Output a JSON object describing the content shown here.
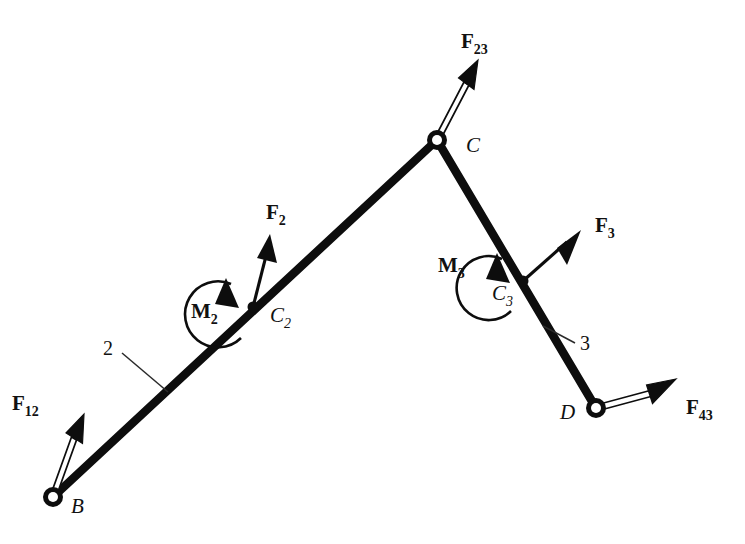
{
  "figure": {
    "background_color": "#ffffff",
    "ink_color": "#0d0d0d",
    "width": 745,
    "height": 544,
    "type": "free-body-diagram"
  },
  "joints": [
    {
      "id": "B",
      "label": "B",
      "x": 53,
      "y": 497,
      "style": "pin-hollow",
      "label_x": 71,
      "label_y": 513
    },
    {
      "id": "C",
      "label": "C",
      "x": 437,
      "y": 140,
      "style": "pin-hollow",
      "label_x": 466,
      "label_y": 152
    },
    {
      "id": "D",
      "label": "D",
      "x": 596,
      "y": 408,
      "style": "pin-hollow",
      "label_x": 560,
      "label_y": 419
    }
  ],
  "mass_centers": [
    {
      "id": "C2",
      "label": "C",
      "sub": "2",
      "x": 253,
      "y": 307,
      "label_x": 270,
      "label_y": 322
    },
    {
      "id": "C3",
      "label": "C",
      "sub": "3",
      "x": 523,
      "y": 281,
      "label_x": 492,
      "label_y": 300
    }
  ],
  "links": [
    {
      "id": "2",
      "label": "2",
      "from": "B",
      "to": "C",
      "label_x": 103,
      "label_y": 355,
      "leader_from_x": 122,
      "leader_from_y": 353,
      "leader_to_x": 168,
      "leader_to_y": 392
    },
    {
      "id": "3",
      "label": "3",
      "from": "C",
      "to": "D",
      "label_x": 580,
      "label_y": 350,
      "leader_from_x": 575,
      "leader_from_y": 343,
      "leader_to_x": 543,
      "leader_to_y": 326
    }
  ],
  "forces": [
    {
      "id": "F12",
      "label": "F",
      "sub": "12",
      "style": "open",
      "tail_x": 53,
      "tail_y": 497,
      "tip_x": 84,
      "tip_y": 414,
      "label_x": 12,
      "label_y": 410
    },
    {
      "id": "F23",
      "label": "F",
      "sub": "23",
      "style": "open",
      "tail_x": 437,
      "tail_y": 140,
      "tip_x": 478,
      "tip_y": 60,
      "label_x": 461,
      "label_y": 48
    },
    {
      "id": "F43",
      "label": "F",
      "sub": "43",
      "style": "open",
      "tail_x": 596,
      "tail_y": 408,
      "tip_x": 676,
      "tip_y": 379,
      "label_x": 686,
      "label_y": 414
    },
    {
      "id": "F2",
      "label": "F",
      "sub": "2",
      "style": "solid",
      "tail_x": 253,
      "tail_y": 307,
      "tip_x": 270,
      "tip_y": 234,
      "label_x": 266,
      "label_y": 219
    },
    {
      "id": "F3",
      "label": "F",
      "sub": "3",
      "style": "solid",
      "tail_x": 523,
      "tail_y": 281,
      "tip_x": 581,
      "tip_y": 230,
      "label_x": 595,
      "label_y": 232
    }
  ],
  "moments": [
    {
      "id": "M2",
      "label": "M",
      "sub": "2",
      "center_x": 253,
      "center_y": 307,
      "radius": 33,
      "direction": "counterclockwise",
      "label_x": 191,
      "label_y": 318
    },
    {
      "id": "M3",
      "label": "M",
      "sub": "3",
      "center_x": 523,
      "center_y": 281,
      "radius": 32,
      "direction": "counterclockwise",
      "label_x": 438,
      "label_y": 272
    }
  ]
}
